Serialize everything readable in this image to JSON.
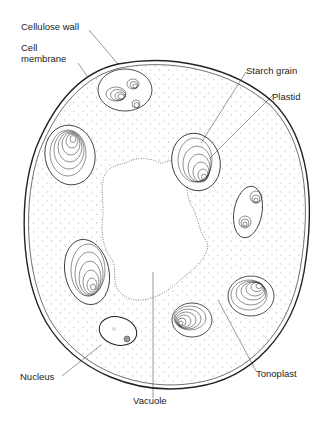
{
  "diagram": {
    "labels": {
      "cellulose_wall": "Cellulose wall",
      "cell_membrane_line1": "Cell",
      "cell_membrane_line2": "membrane",
      "starch_grain": "Starch grain",
      "plastid": "Plastid",
      "nucleus": "Nucleus",
      "vacuole": "Vacuole",
      "tonoplast": "Tonoplast"
    },
    "colors": {
      "stroke": "#222222",
      "background": "#ffffff",
      "stipple": "#555555"
    }
  }
}
